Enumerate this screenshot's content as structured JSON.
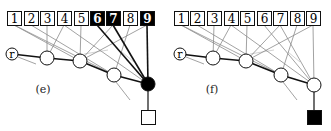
{
  "figure": {
    "width": 331,
    "height": 131,
    "colors": {
      "background": "#ffffff",
      "stroke": "#111111",
      "thin_edge": "#8a8a8a",
      "faint_edge": "#c8c8c8",
      "filled": "#000000",
      "box_fill": "#ffffff"
    }
  },
  "panels": [
    {
      "id": "e",
      "caption": "(e)",
      "caption_pos": [
        43,
        93
      ],
      "boxes": [
        {
          "label": "1",
          "x": 7,
          "filled": false
        },
        {
          "label": "2",
          "x": 24,
          "filled": false
        },
        {
          "label": "3",
          "x": 40,
          "filled": false
        },
        {
          "label": "4",
          "x": 57,
          "filled": false
        },
        {
          "label": "5",
          "x": 74,
          "filled": false
        },
        {
          "label": "6",
          "x": 90,
          "filled": true
        },
        {
          "label": "7",
          "x": 106,
          "filled": true
        },
        {
          "label": "8",
          "x": 123,
          "filled": false
        },
        {
          "label": "9",
          "x": 140,
          "filled": true
        }
      ],
      "box_y": 11,
      "box_size": 14,
      "root": {
        "label": "r",
        "cx": 12,
        "cy": 54,
        "r": 6
      },
      "chain": [
        {
          "cx": 47,
          "cy": 58,
          "r": 7,
          "filled": false
        },
        {
          "cx": 80,
          "cy": 61,
          "r": 7,
          "filled": false
        },
        {
          "cx": 114,
          "cy": 75,
          "r": 7,
          "filled": false
        },
        {
          "cx": 148,
          "cy": 84,
          "r": 7,
          "filled": true
        }
      ],
      "output": {
        "x": 141,
        "y": 110,
        "size": 14,
        "filled": false
      },
      "thick_edges": [
        [
          6,
          3
        ],
        [
          7,
          3
        ],
        [
          9,
          3
        ]
      ],
      "thin_edges": [
        [
          1,
          1
        ],
        [
          1,
          2
        ],
        [
          2,
          2
        ],
        [
          3,
          0
        ],
        [
          4,
          0
        ],
        [
          4,
          3
        ],
        [
          5,
          1
        ],
        [
          7,
          1
        ],
        [
          8,
          2
        ],
        [
          9,
          1
        ]
      ],
      "root_tail": [
        [
          18,
          57
        ],
        [
          36,
          64
        ]
      ],
      "node_tail": [
        [
          116,
          82
        ],
        [
          130,
          100
        ]
      ],
      "faint_arcs": [
        [
          [
            84,
            54
          ],
          [
            108,
            50
          ]
        ],
        [
          [
            122,
            52
          ],
          [
            134,
            62
          ]
        ]
      ]
    },
    {
      "id": "f",
      "caption": "(f)",
      "caption_pos": [
        212,
        93
      ],
      "boxes": [
        {
          "label": "1",
          "x": 174,
          "filled": false
        },
        {
          "label": "2",
          "x": 190,
          "filled": false
        },
        {
          "label": "3",
          "x": 207,
          "filled": false
        },
        {
          "label": "4",
          "x": 224,
          "filled": false
        },
        {
          "label": "5",
          "x": 240,
          "filled": false
        },
        {
          "label": "6",
          "x": 257,
          "filled": false
        },
        {
          "label": "7",
          "x": 273,
          "filled": false
        },
        {
          "label": "8",
          "x": 290,
          "filled": false
        },
        {
          "label": "9",
          "x": 306,
          "filled": false
        }
      ],
      "box_y": 11,
      "box_size": 14,
      "root": {
        "label": "r",
        "cx": 180,
        "cy": 54,
        "r": 6
      },
      "chain": [
        {
          "cx": 213,
          "cy": 58,
          "r": 7,
          "filled": false
        },
        {
          "cx": 246,
          "cy": 61,
          "r": 7,
          "filled": false
        },
        {
          "cx": 281,
          "cy": 75,
          "r": 7,
          "filled": false
        },
        {
          "cx": 314,
          "cy": 85,
          "r": 7,
          "filled": false
        }
      ],
      "output": {
        "x": 307,
        "y": 110,
        "size": 14,
        "filled": true
      },
      "thick_edges": [],
      "thin_edges": [
        [
          1,
          1
        ],
        [
          1,
          2
        ],
        [
          2,
          2
        ],
        [
          3,
          0
        ],
        [
          4,
          0
        ],
        [
          4,
          3
        ],
        [
          5,
          1
        ],
        [
          6,
          3
        ],
        [
          7,
          1
        ],
        [
          7,
          3
        ],
        [
          8,
          2
        ],
        [
          9,
          1
        ],
        [
          9,
          3
        ]
      ],
      "root_tail": [
        [
          186,
          57
        ],
        [
          204,
          64
        ]
      ],
      "node_tail": [
        [
          283,
          82
        ],
        [
          297,
          100
        ]
      ],
      "faint_arcs": [
        [
          [
            250,
            54
          ],
          [
            274,
            50
          ]
        ],
        [
          [
            288,
            52
          ],
          [
            300,
            62
          ]
        ]
      ]
    }
  ]
}
